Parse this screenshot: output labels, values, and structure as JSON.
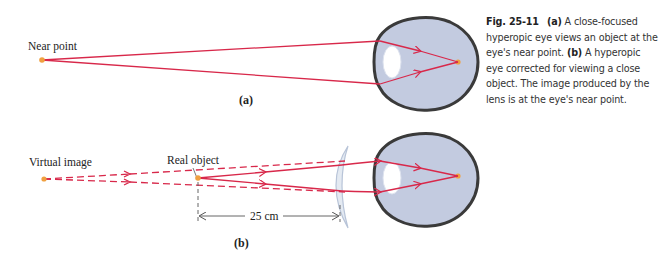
{
  "figure": {
    "number": "Fig. 25-11",
    "colors": {
      "ray": "#d8284a",
      "eye_fill": "#c3cbe0",
      "eye_outline": "#3a3a3a",
      "lens_fill": "#ffffff",
      "point": "#f0a040",
      "corrective_lens": "#b8c4d8",
      "dimension_line": "#555555"
    }
  },
  "panel_a": {
    "label": "(a)",
    "point_label": "Near point"
  },
  "panel_b": {
    "label": "(b)",
    "virtual_image_label": "Virtual image",
    "real_object_label": "Real object",
    "distance_label": "25 cm"
  },
  "caption": {
    "fig_num": "Fig. 25-11",
    "part_a": "(a)",
    "text_a": " A close-focused hyperopic eye views an object at the eye's near point. ",
    "part_b": "(b)",
    "text_b": " A hyperopic eye corrected for viewing a close object. The image produced by the lens is at the eye's near point."
  }
}
